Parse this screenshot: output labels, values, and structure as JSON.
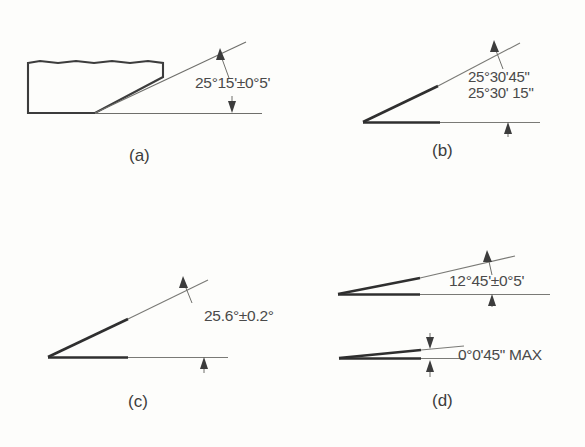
{
  "figure": {
    "background_color": "#fdfdfb",
    "ink_color": "#3c3c3c",
    "thin_line_color": "#8a8a86"
  },
  "panels": [
    {
      "id": "panel-a",
      "label": "(a)",
      "kind": "chamfered-block-with-angle",
      "dimension": {
        "full_text": "25°15'±0°5'",
        "parts": [
          {
            "value": "25",
            "unit": "°"
          },
          {
            "value": "15",
            "unit": "'"
          },
          {
            "value": "±0",
            "unit": "°"
          },
          {
            "value": "5",
            "unit": "'"
          }
        ],
        "nominal": "25°15'",
        "tolerance": "±0°5'"
      }
    },
    {
      "id": "panel-b",
      "label": "(b)",
      "kind": "angle-limit-dimension",
      "dimension": {
        "line1": "25°30'45\"",
        "line2": "25°30' 15\"",
        "upper_limit": "25°30'45\"",
        "lower_limit": "25°30'15\""
      }
    },
    {
      "id": "panel-c",
      "label": "(c)",
      "kind": "angle-decimal-degrees",
      "dimension": {
        "full_text": "25.6°±0.2°",
        "nominal": "25.6°",
        "tolerance": "±0.2°"
      }
    },
    {
      "id": "panel-d",
      "label": "(d)",
      "kind": "angle-plus-angularity-max",
      "dimension_upper": {
        "full_text": "12°45'±0°5'",
        "nominal": "12°45'",
        "tolerance": "±0°5'"
      },
      "dimension_lower": {
        "full_text": "0°0'45\" MAX",
        "nominal": "0°0'45\"",
        "modifier": "MAX"
      }
    }
  ]
}
